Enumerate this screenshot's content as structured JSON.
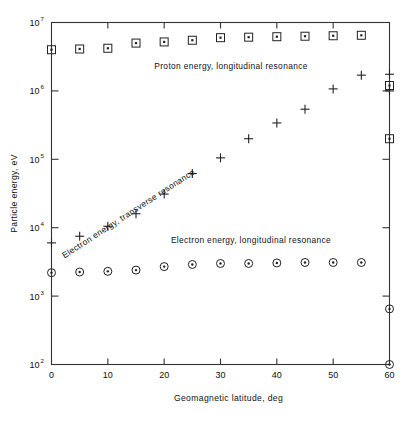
{
  "figure": {
    "title": "",
    "background": "#ffffff",
    "ink_color": "#222222"
  },
  "axes": {
    "x": {
      "label": "Geomagnetic latitude, deg",
      "ticks": [
        "0",
        "10",
        "20",
        "30",
        "40",
        "50",
        "60"
      ],
      "min": 0,
      "max": 60
    },
    "y": {
      "label": "Particle energy, eV",
      "tick_mantissa": "10",
      "tick_exponents": [
        "2",
        "3",
        "4",
        "5",
        "6",
        "7"
      ],
      "min": 100,
      "max": 10000000,
      "scale": "log"
    }
  },
  "annotations": [
    {
      "name": "proton-longitudinal-label",
      "text": "Proton energy, longitudinal resonance",
      "rotation": 0
    },
    {
      "name": "electron-transverse-label",
      "text": "Electron energy, transverse resonance",
      "rotation": -30
    },
    {
      "name": "electron-longitudinal-label",
      "text": "Electron energy, longitudinal resonance",
      "rotation": 0
    }
  ],
  "chart_data": {
    "type": "scatter",
    "title": "",
    "xlabel": "Geomagnetic latitude, deg",
    "ylabel": "Particle energy, eV",
    "xlim": [
      0,
      60
    ],
    "ylim": [
      100,
      10000000
    ],
    "yscale": "log",
    "grid": false,
    "legend": "inline-annotations",
    "series": [
      {
        "name": "Proton energy, longitudinal resonance",
        "marker": "square-dot",
        "x": [
          0,
          5,
          10,
          15,
          20,
          25,
          30,
          35,
          40,
          45,
          50,
          55,
          60,
          60
        ],
        "y": [
          4000000.0,
          4100000.0,
          4200000.0,
          5000000.0,
          5200000.0,
          5500000.0,
          6000000.0,
          6100000.0,
          6200000.0,
          6300000.0,
          6400000.0,
          6500000.0,
          1200000.0,
          200000.0
        ]
      },
      {
        "name": "Electron energy, transverse resonance",
        "marker": "plus",
        "x": [
          0,
          5,
          10,
          15,
          20,
          25,
          30,
          35,
          40,
          45,
          50,
          55,
          60,
          60
        ],
        "y": [
          6000.0,
          7500.0,
          10500.0,
          16000.0,
          31000.0,
          62000.0,
          105000.0,
          200000.0,
          340000.0,
          540000.0,
          1070000.0,
          1700000.0,
          1750000.0,
          1000000.0
        ]
      },
      {
        "name": "Electron energy, longitudinal resonance",
        "marker": "circle-dot",
        "x": [
          0,
          5,
          10,
          15,
          20,
          25,
          30,
          35,
          40,
          45,
          50,
          55,
          60,
          60
        ],
        "y": [
          2200.0,
          2250.0,
          2300.0,
          2400.0,
          2700.0,
          2900.0,
          3000.0,
          3000.0,
          3050.0,
          3100.0,
          3100.0,
          3100.0,
          650.0,
          100.0
        ]
      }
    ]
  }
}
